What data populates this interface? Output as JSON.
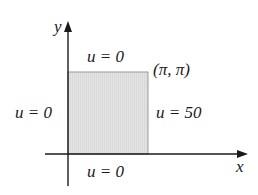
{
  "diagram": {
    "type": "boundary-value-region",
    "axes": {
      "x_label": "x",
      "y_label": "y"
    },
    "region": {
      "shape": "square",
      "corner_label": "(π, π)",
      "fill_color": "#e2e2e2",
      "border_color": "#9a9a9a"
    },
    "boundary_conditions": {
      "top": "u = 0",
      "left": "u = 0",
      "right": "u = 50",
      "bottom": "u = 0"
    },
    "colors": {
      "axis": "#1a1a1a",
      "text": "#1a1a1a"
    }
  }
}
